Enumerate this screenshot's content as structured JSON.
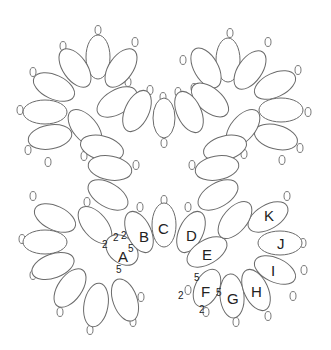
{
  "diagram": {
    "stroke_color": "#6b6b6b",
    "rings": [
      {
        "cx": 98,
        "cy": 57,
        "rx": 12,
        "ry": 22,
        "rot": 0
      },
      {
        "cx": 75,
        "cy": 68,
        "rx": 12,
        "ry": 22,
        "rot": -35
      },
      {
        "cx": 121,
        "cy": 68,
        "rx": 12,
        "ry": 22,
        "rot": 35
      },
      {
        "cx": 54,
        "cy": 87,
        "rx": 12,
        "ry": 22,
        "rot": -65
      },
      {
        "cx": 45,
        "cy": 112,
        "rx": 12,
        "ry": 22,
        "rot": -90
      },
      {
        "cx": 50,
        "cy": 137,
        "rx": 12,
        "ry": 22,
        "rot": -100
      },
      {
        "cx": 117,
        "cy": 102,
        "rx": 12,
        "ry": 22,
        "rot": 60
      },
      {
        "cx": 137,
        "cy": 111,
        "rx": 12,
        "ry": 22,
        "rot": 25
      },
      {
        "cx": 85,
        "cy": 128,
        "rx": 12,
        "ry": 22,
        "rot": -40
      },
      {
        "cx": 102,
        "cy": 148,
        "rx": 12,
        "ry": 22,
        "rot": -75
      },
      {
        "cx": 228,
        "cy": 60,
        "rx": 12,
        "ry": 22,
        "rot": 0
      },
      {
        "cx": 206,
        "cy": 68,
        "rx": 12,
        "ry": 22,
        "rot": -30
      },
      {
        "cx": 250,
        "cy": 70,
        "rx": 12,
        "ry": 22,
        "rot": 35
      },
      {
        "cx": 275,
        "cy": 85,
        "rx": 12,
        "ry": 22,
        "rot": 65
      },
      {
        "cx": 281,
        "cy": 110,
        "rx": 12,
        "ry": 22,
        "rot": 90
      },
      {
        "cx": 276,
        "cy": 137,
        "rx": 12,
        "ry": 22,
        "rot": 105
      },
      {
        "cx": 210,
        "cy": 100,
        "rx": 12,
        "ry": 22,
        "rot": -50
      },
      {
        "cx": 189,
        "cy": 112,
        "rx": 12,
        "ry": 22,
        "rot": -25
      },
      {
        "cx": 243,
        "cy": 128,
        "rx": 12,
        "ry": 22,
        "rot": 40
      },
      {
        "cx": 225,
        "cy": 148,
        "rx": 12,
        "ry": 22,
        "rot": 75
      },
      {
        "cx": 110,
        "cy": 168,
        "rx": 12,
        "ry": 22,
        "rot": -80
      },
      {
        "cx": 108,
        "cy": 195,
        "rx": 12,
        "ry": 22,
        "rot": -60
      },
      {
        "cx": 217,
        "cy": 168,
        "rx": 12,
        "ry": 22,
        "rot": 80
      },
      {
        "cx": 218,
        "cy": 195,
        "rx": 12,
        "ry": 22,
        "rot": 60
      },
      {
        "cx": 164,
        "cy": 118,
        "rx": 11,
        "ry": 20,
        "rot": 0
      },
      {
        "cx": 55,
        "cy": 218,
        "rx": 12,
        "ry": 22,
        "rot": -65
      },
      {
        "cx": 45,
        "cy": 242,
        "rx": 12,
        "ry": 22,
        "rot": -90
      },
      {
        "cx": 53,
        "cy": 266,
        "rx": 12,
        "ry": 22,
        "rot": -110
      },
      {
        "cx": 70,
        "cy": 288,
        "rx": 12,
        "ry": 22,
        "rot": -145
      },
      {
        "cx": 96,
        "cy": 305,
        "rx": 12,
        "ry": 22,
        "rot": -170
      },
      {
        "cx": 125,
        "cy": 300,
        "rx": 12,
        "ry": 22,
        "rot": 160
      },
      {
        "cx": 95,
        "cy": 225,
        "rx": 12,
        "ry": 22,
        "rot": -40
      },
      {
        "cx": 122,
        "cy": 250,
        "rx": 13,
        "ry": 18,
        "rot": -50,
        "label": "A",
        "lx": 118,
        "ly": 262
      },
      {
        "cx": 139,
        "cy": 232,
        "rx": 12,
        "ry": 22,
        "rot": -25,
        "label": "B",
        "lx": 139,
        "ly": 242
      },
      {
        "cx": 164,
        "cy": 225,
        "rx": 12,
        "ry": 22,
        "rot": 0,
        "label": "C",
        "lx": 158,
        "ly": 234
      },
      {
        "cx": 191,
        "cy": 232,
        "rx": 12,
        "ry": 22,
        "rot": 25,
        "label": "D",
        "lx": 186,
        "ly": 241
      },
      {
        "cx": 207,
        "cy": 252,
        "rx": 12,
        "ry": 22,
        "rot": 60,
        "label": "E",
        "lx": 202,
        "ly": 260
      },
      {
        "cx": 207,
        "cy": 288,
        "rx": 12,
        "ry": 20,
        "rot": 25,
        "label": "F",
        "lx": 201,
        "ly": 297
      },
      {
        "cx": 232,
        "cy": 296,
        "rx": 12,
        "ry": 22,
        "rot": -5,
        "label": "G",
        "lx": 227,
        "ly": 304
      },
      {
        "cx": 256,
        "cy": 290,
        "rx": 12,
        "ry": 22,
        "rot": -25,
        "label": "H",
        "lx": 251,
        "ly": 297
      },
      {
        "cx": 275,
        "cy": 270,
        "rx": 12,
        "ry": 22,
        "rot": -65,
        "label": "I",
        "lx": 271,
        "ly": 276
      },
      {
        "cx": 280,
        "cy": 243,
        "rx": 12,
        "ry": 22,
        "rot": -90,
        "label": "J",
        "lx": 277,
        "ly": 249
      },
      {
        "cx": 268,
        "cy": 217,
        "rx": 12,
        "ry": 22,
        "rot": -120,
        "label": "K",
        "lx": 264,
        "ly": 221
      },
      {
        "cx": 235,
        "cy": 220,
        "rx": 12,
        "ry": 22,
        "rot": 40
      }
    ],
    "picots": [
      {
        "x": 98,
        "y": 30
      },
      {
        "x": 63,
        "y": 46
      },
      {
        "x": 135,
        "y": 42
      },
      {
        "x": 33,
        "y": 72
      },
      {
        "x": 20,
        "y": 110
      },
      {
        "x": 28,
        "y": 150
      },
      {
        "x": 48,
        "y": 162
      },
      {
        "x": 128,
        "y": 82
      },
      {
        "x": 150,
        "y": 90
      },
      {
        "x": 84,
        "y": 156
      },
      {
        "x": 230,
        "y": 33
      },
      {
        "x": 183,
        "y": 60
      },
      {
        "x": 268,
        "y": 42
      },
      {
        "x": 298,
        "y": 70
      },
      {
        "x": 308,
        "y": 112
      },
      {
        "x": 300,
        "y": 148
      },
      {
        "x": 282,
        "y": 160
      },
      {
        "x": 194,
        "y": 88
      },
      {
        "x": 178,
        "y": 92
      },
      {
        "x": 244,
        "y": 154
      },
      {
        "x": 163,
        "y": 97
      },
      {
        "x": 164,
        "y": 143
      },
      {
        "x": 136,
        "y": 165
      },
      {
        "x": 192,
        "y": 165
      },
      {
        "x": 33,
        "y": 196
      },
      {
        "x": 22,
        "y": 239
      },
      {
        "x": 33,
        "y": 275
      },
      {
        "x": 60,
        "y": 312
      },
      {
        "x": 90,
        "y": 330
      },
      {
        "x": 133,
        "y": 322
      },
      {
        "x": 141,
        "y": 297
      },
      {
        "x": 87,
        "y": 202
      },
      {
        "x": 164,
        "y": 200
      },
      {
        "x": 140,
        "y": 207
      },
      {
        "x": 188,
        "y": 207
      },
      {
        "x": 110,
        "y": 242
      },
      {
        "x": 188,
        "y": 290
      },
      {
        "x": 206,
        "y": 312
      },
      {
        "x": 236,
        "y": 322
      },
      {
        "x": 268,
        "y": 316
      },
      {
        "x": 293,
        "y": 296
      },
      {
        "x": 304,
        "y": 270
      },
      {
        "x": 303,
        "y": 243
      },
      {
        "x": 287,
        "y": 196
      },
      {
        "x": 247,
        "y": 208
      }
    ],
    "counts": [
      {
        "text": "2",
        "x": 113,
        "y": 241
      },
      {
        "text": "2",
        "x": 121,
        "y": 239
      },
      {
        "text": "2",
        "x": 102,
        "y": 248
      },
      {
        "text": "5",
        "x": 128,
        "y": 252
      },
      {
        "text": "5",
        "x": 116,
        "y": 273
      },
      {
        "text": "5",
        "x": 194,
        "y": 281
      },
      {
        "text": "2",
        "x": 178,
        "y": 299
      },
      {
        "text": "2",
        "x": 199,
        "y": 313
      },
      {
        "text": "5",
        "x": 216,
        "y": 296
      }
    ]
  }
}
